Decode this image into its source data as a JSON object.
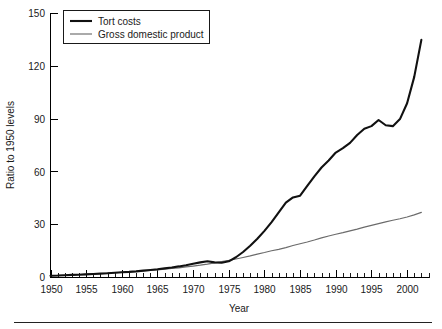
{
  "chart_data": {
    "type": "line",
    "title": "",
    "xlabel": "Year",
    "ylabel": "Ratio to 1950 levels",
    "xlim": [
      1950,
      2003
    ],
    "ylim": [
      0,
      150
    ],
    "ytick_values": [
      0,
      30,
      60,
      90,
      120,
      150
    ],
    "ytick_labels": [
      "0",
      "30",
      "60",
      "90",
      "120",
      "150"
    ],
    "xtick_values": [
      1950,
      1955,
      1960,
      1965,
      1970,
      1975,
      1980,
      1985,
      1990,
      1995,
      2000
    ],
    "xtick_labels": [
      "1950",
      "1955",
      "1960",
      "1965",
      "1970",
      "1975",
      "1980",
      "1985",
      "1990",
      "1995",
      "2000"
    ],
    "minor_xtick_interval": 1,
    "grid": false,
    "legend_position": "top-left",
    "x": [
      1950,
      1951,
      1952,
      1953,
      1954,
      1955,
      1956,
      1957,
      1958,
      1959,
      1960,
      1961,
      1962,
      1963,
      1964,
      1965,
      1966,
      1967,
      1968,
      1969,
      1970,
      1971,
      1972,
      1973,
      1974,
      1975,
      1976,
      1977,
      1978,
      1979,
      1980,
      1981,
      1982,
      1983,
      1984,
      1985,
      1986,
      1987,
      1988,
      1989,
      1990,
      1991,
      1992,
      1993,
      1994,
      1995,
      1996,
      1997,
      1998,
      1999,
      2000,
      2001,
      2002
    ],
    "series": [
      {
        "name": "Tort costs",
        "color": "#111111",
        "values": [
          1.0,
          1.1,
          1.3,
          1.5,
          1.6,
          1.8,
          2.0,
          2.2,
          2.4,
          2.7,
          3.0,
          3.2,
          3.5,
          3.9,
          4.3,
          4.7,
          5.2,
          5.7,
          6.3,
          7.0,
          7.8,
          8.6,
          9.2,
          8.6,
          8.4,
          9.2,
          11.5,
          14.5,
          18.0,
          22.0,
          26.5,
          31.5,
          37.0,
          42.5,
          45.5,
          46.5,
          52.0,
          57.5,
          62.5,
          66.5,
          71.0,
          73.5,
          76.5,
          81.0,
          84.5,
          86.0,
          89.5,
          86.5,
          86.0,
          90.0,
          99.0,
          114.0,
          135.0
        ]
      },
      {
        "name": "Gross domestic product",
        "color": "#6b6b6b",
        "values": [
          1.0,
          1.2,
          1.3,
          1.5,
          1.6,
          1.8,
          2.0,
          2.2,
          2.3,
          2.6,
          2.8,
          2.9,
          3.2,
          3.4,
          3.7,
          4.1,
          4.6,
          5.0,
          5.5,
          6.1,
          6.5,
          7.1,
          7.9,
          8.9,
          9.7,
          10.6,
          11.9,
          13.3,
          15.1,
          17.0,
          18.5,
          20.8,
          21.8,
          23.6,
          26.3,
          28.1,
          29.6,
          31.4,
          33.8,
          36.3,
          38.4,
          39.6,
          41.7,
          43.9,
          46.5,
          48.8,
          51.5,
          54.6,
          57.3,
          60.6,
          64.2,
          66.3,
          68.7
        ]
      }
    ],
    "series_display_scale_note": "Gross domestic product plotted reaching about 37 at 2002 on the ratio axis",
    "gdp_plotted_values": [
      1.0,
      1.1,
      1.3,
      1.5,
      1.7,
      1.9,
      2.1,
      2.3,
      2.5,
      2.7,
      2.9,
      3.1,
      3.4,
      3.7,
      4.0,
      4.3,
      4.7,
      5.1,
      5.5,
      6.0,
      6.5,
      7.0,
      7.6,
      8.3,
      9.0,
      9.7,
      10.5,
      11.4,
      12.3,
      13.3,
      14.2,
      15.2,
      16.0,
      17.0,
      18.2,
      19.2,
      20.2,
      21.3,
      22.5,
      23.6,
      24.6,
      25.5,
      26.5,
      27.5,
      28.6,
      29.6,
      30.6,
      31.6,
      32.5,
      33.4,
      34.4,
      35.6,
      37.0
    ]
  },
  "legend": {
    "items": [
      {
        "label": "Tort costs",
        "style": "thick-black"
      },
      {
        "label": "Gross domestic product",
        "style": "thin-gray"
      }
    ]
  },
  "axes": {
    "y_title": "Ratio to 1950 levels",
    "x_title": "Year"
  },
  "colors": {
    "tort": "#111111",
    "gdp": "#6b6b6b",
    "axis": "#000000",
    "background": "#ffffff"
  }
}
